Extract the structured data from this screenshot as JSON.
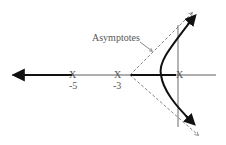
{
  "diagram": {
    "annotation": "Asymptotes",
    "poles": [
      {
        "label": "-5",
        "symbol": "X"
      },
      {
        "label": "-3",
        "symbol": "X"
      },
      {
        "label": "",
        "symbol": "X"
      }
    ],
    "colors": {
      "line": "#111111",
      "text": "#555555",
      "dashed": "#666666"
    }
  }
}
